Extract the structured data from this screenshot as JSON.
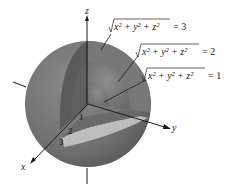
{
  "figure": {
    "type": "nested-spheres-cutaway",
    "axes": {
      "x_label": "x",
      "y_label": "y",
      "z_label": "z"
    },
    "equations": [
      {
        "lhs": "x² + y² + z²",
        "rhs": "= 3"
      },
      {
        "lhs": "x² + y² + z²",
        "rhs": "= 2"
      },
      {
        "lhs": "x² + y² + z²",
        "rhs": "= 1"
      }
    ],
    "radius_labels": [
      "1",
      "2",
      "3"
    ],
    "colors": {
      "outer_sphere": "#707070",
      "middle_shell": "#7c7c7c",
      "inner_shell": "#6e6e6e",
      "cut_band": "#bdbdbd",
      "axis": "#1a1a1a"
    }
  }
}
